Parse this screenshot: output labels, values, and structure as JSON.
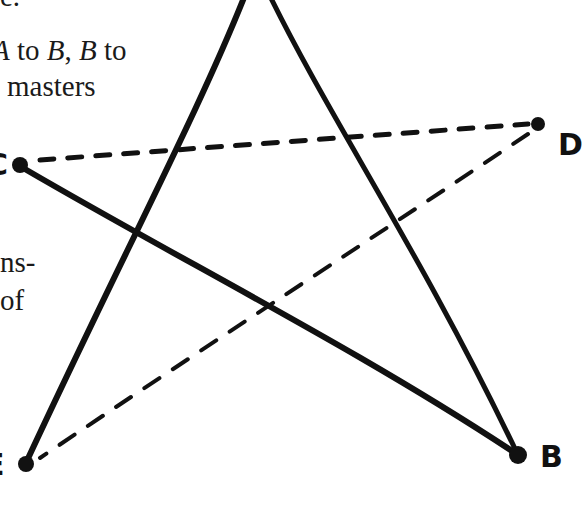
{
  "text": {
    "line_fragment_top": "e.",
    "line1_a": "A",
    "line1_mid": " to ",
    "line1_b": "B",
    "line1_comma": ", ",
    "line1_b2": "B",
    "line1_end": " to",
    "line2": "masters",
    "line3": "ns-",
    "line4": "of"
  },
  "labels": {
    "C": "C",
    "D": "D",
    "B": "B",
    "E": "E"
  },
  "diagram": {
    "type": "pentagram",
    "points": {
      "A": [
        257,
        -30
      ],
      "B": [
        518,
        455
      ],
      "C": [
        18,
        165
      ],
      "D": [
        538,
        124
      ],
      "E": [
        25,
        465
      ]
    },
    "solid_edges": [
      [
        "A",
        "E"
      ],
      [
        "A",
        "B"
      ],
      [
        "C",
        "B"
      ]
    ],
    "dashed_edges": [
      [
        "C",
        "D"
      ],
      [
        "D",
        "E"
      ]
    ],
    "stroke_color": "#111111"
  }
}
